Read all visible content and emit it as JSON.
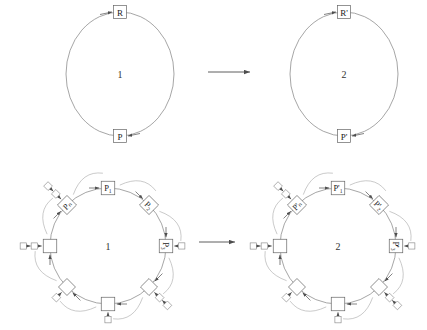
{
  "figure": {
    "type": "diagram",
    "background": "#ffffff",
    "stroke_color": "#808080",
    "text_color": "#333333",
    "arrow_symbol": "→"
  },
  "panels": [
    {
      "id": "top-left",
      "center_label": "1",
      "cx": 120,
      "cy": 74,
      "rx": 54,
      "ry": 62,
      "nodes": [
        {
          "name": "reactant-node",
          "label": "R",
          "angle": -90,
          "box": "square",
          "in_arrow_from": "left"
        },
        {
          "name": "product-node",
          "label": "P",
          "angle": 90,
          "box": "square",
          "in_arrow_from": "right"
        }
      ]
    },
    {
      "id": "top-right",
      "center_label": "2",
      "cx": 344,
      "cy": 74,
      "rx": 54,
      "ry": 62,
      "nodes": [
        {
          "name": "reactant-node",
          "label": "R'",
          "angle": -90,
          "box": "square",
          "in_arrow_from": "left"
        },
        {
          "name": "product-node",
          "label": "P'",
          "angle": 90,
          "box": "square",
          "in_arrow_from": "right"
        }
      ]
    },
    {
      "id": "bottom-left",
      "center_label": "1",
      "cx": 108,
      "cy": 246,
      "rx": 58,
      "ry": 58,
      "nodes": [
        {
          "name": "ring-node-p1",
          "label": "P₁",
          "angle": -90,
          "box": "square",
          "rotation": 0,
          "satellites": 0,
          "arc": true
        },
        {
          "name": "ring-node-p2",
          "label": "P₂",
          "angle": -45,
          "box": "square",
          "rotation": 45,
          "satellites": 0,
          "arc": true
        },
        {
          "name": "ring-node-p3",
          "label": "P₃",
          "angle": 0,
          "box": "square",
          "rotation": 90,
          "satellites": 1,
          "arc": true
        },
        {
          "name": "ring-node-p4",
          "label": "",
          "angle": 45,
          "box": "diamond",
          "rotation": 45,
          "satellites": 2,
          "arc": true
        },
        {
          "name": "ring-node-p5",
          "label": "",
          "angle": 90,
          "box": "square",
          "rotation": 0,
          "satellites": 1,
          "arc": true
        },
        {
          "name": "ring-node-p6",
          "label": "",
          "angle": 135,
          "box": "diamond",
          "rotation": 45,
          "satellites": 1,
          "arc": true
        },
        {
          "name": "ring-node-p7",
          "label": "",
          "angle": 180,
          "box": "square",
          "rotation": 0,
          "satellites": 2,
          "arc": true
        },
        {
          "name": "ring-node-pn",
          "label": "Pₙ",
          "angle": -135,
          "box": "square",
          "rotation": -45,
          "satellites": 2,
          "arc": true
        }
      ]
    },
    {
      "id": "bottom-right",
      "center_label": "2",
      "cx": 338,
      "cy": 246,
      "rx": 58,
      "ry": 58,
      "nodes": [
        {
          "name": "ring-node-p1",
          "label": "P'₁",
          "angle": -90,
          "box": "square",
          "rotation": 0,
          "satellites": 0,
          "arc": true
        },
        {
          "name": "ring-node-p2",
          "label": "P'₂",
          "angle": -45,
          "box": "square",
          "rotation": 45,
          "satellites": 0,
          "arc": true
        },
        {
          "name": "ring-node-p3",
          "label": "P'₃",
          "angle": 0,
          "box": "square",
          "rotation": 90,
          "satellites": 1,
          "arc": true
        },
        {
          "name": "ring-node-p4",
          "label": "",
          "angle": 45,
          "box": "diamond",
          "rotation": 45,
          "satellites": 2,
          "arc": true
        },
        {
          "name": "ring-node-p5",
          "label": "",
          "angle": 90,
          "box": "square",
          "rotation": 0,
          "satellites": 1,
          "arc": true
        },
        {
          "name": "ring-node-p6",
          "label": "",
          "angle": 135,
          "box": "diamond",
          "rotation": 45,
          "satellites": 1,
          "arc": true
        },
        {
          "name": "ring-node-p7",
          "label": "",
          "angle": 180,
          "box": "square",
          "rotation": 0,
          "satellites": 2,
          "arc": true
        },
        {
          "name": "ring-node-pn",
          "label": "P'ₙ",
          "angle": -135,
          "box": "square",
          "rotation": -45,
          "satellites": 2,
          "arc": true
        }
      ]
    }
  ],
  "transform_arrows": [
    {
      "name": "top-transform-arrow",
      "x1": 208,
      "y1": 72,
      "x2": 250,
      "y2": 72
    },
    {
      "name": "bottom-transform-arrow",
      "x1": 199,
      "y1": 242,
      "x2": 235,
      "y2": 242
    }
  ]
}
